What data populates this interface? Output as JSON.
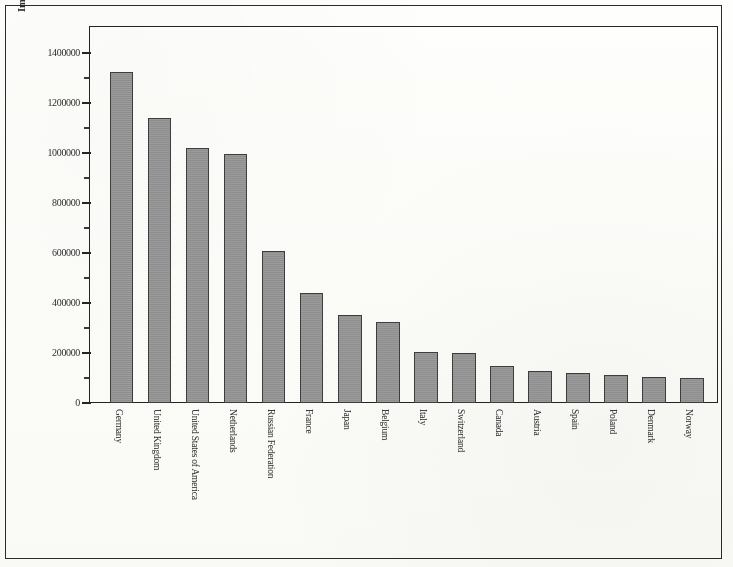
{
  "figure": {
    "ylabel": "Import of car flows and trade(1000 $US)",
    "outer_border_color": "#2b2b2b",
    "plot_border_color": "#242424",
    "bar_fill_color": "#969696",
    "bar_edge_color": "#3d3d3d",
    "background_color": "#fdfdfb"
  },
  "chart_data": {
    "type": "bar",
    "title": "",
    "xlabel": "",
    "ylabel": "Import of car flows and trade(1000 $US)",
    "ylim": [
      0,
      1450000
    ],
    "grid": false,
    "legend": null,
    "ytick_labels": [
      "0",
      "200000",
      "400000",
      "600000",
      "800000",
      "1000000",
      "1200000",
      "1400000"
    ],
    "ytick_values": [
      0,
      200000,
      400000,
      600000,
      800000,
      1000000,
      1200000,
      1400000
    ],
    "minor_ticks": true,
    "categories": [
      "Germany",
      "United Kingdom",
      "United States of America",
      "Netherlands",
      "Russian Federation",
      "France",
      "Japan",
      "Belgium",
      "Italy",
      "Switzerland",
      "Canada",
      "Austria",
      "Spain",
      "Poland",
      "Denmark",
      "Norway"
    ],
    "values": [
      1325000,
      1140000,
      1020000,
      995000,
      608000,
      442000,
      352000,
      325000,
      203000,
      200000,
      148000,
      130000,
      120000,
      113000,
      105000,
      100000
    ]
  }
}
